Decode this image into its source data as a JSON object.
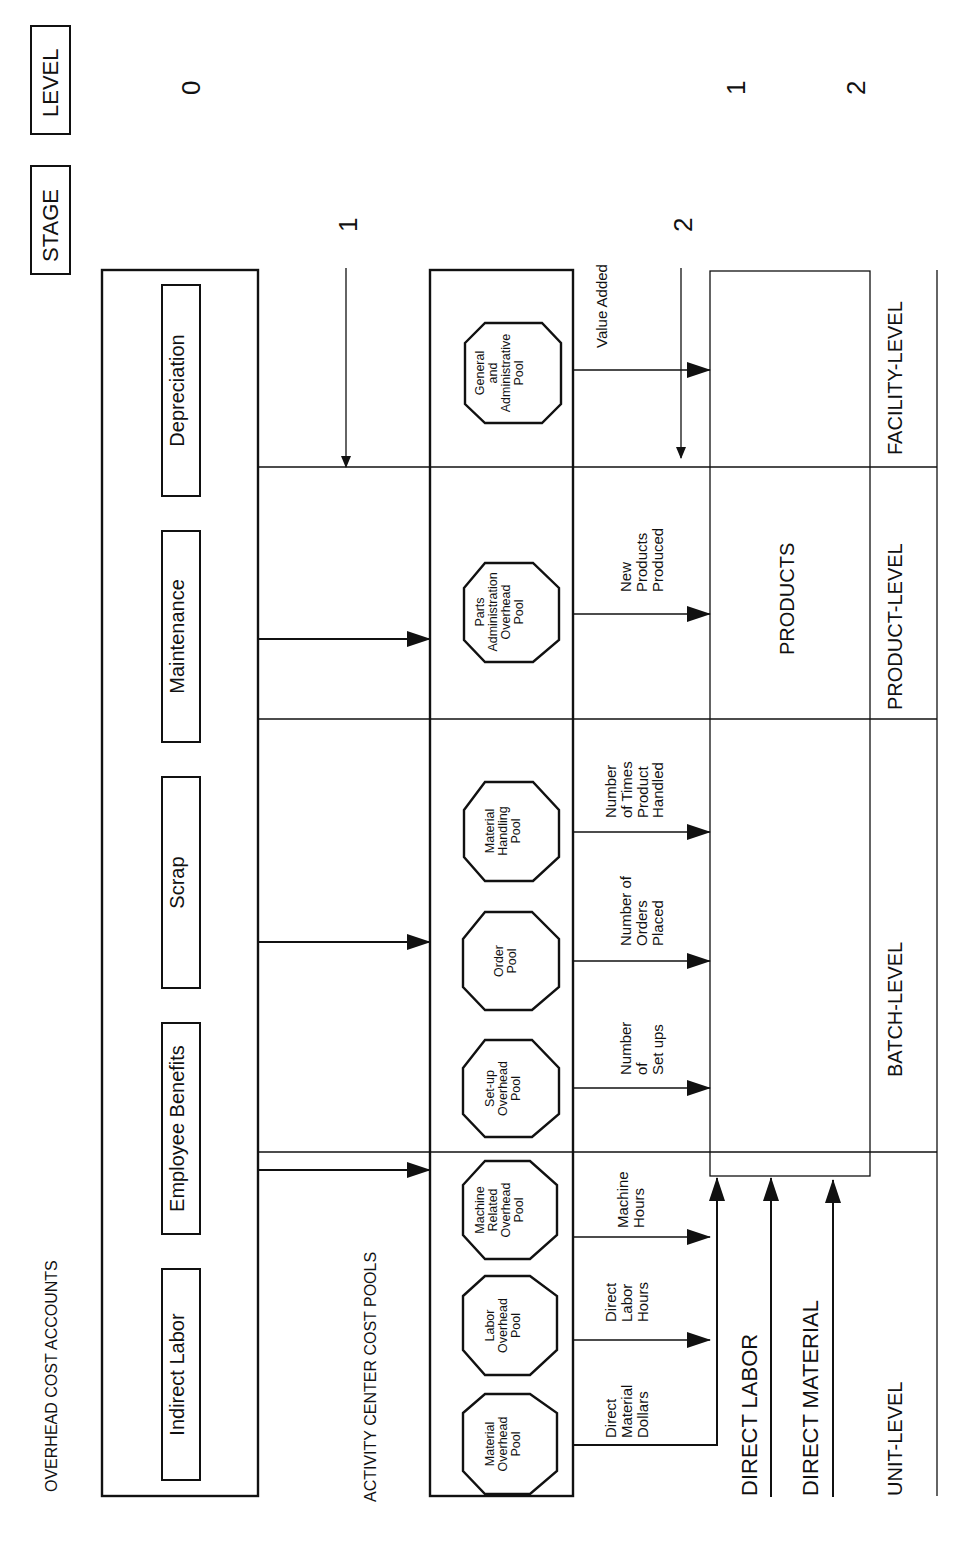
{
  "header": {
    "stage_label": "STAGE",
    "level_label": "LEVEL",
    "level_markers": [
      "0",
      "1",
      "2"
    ],
    "stage_markers": [
      "1",
      "2"
    ]
  },
  "overhead_cost_accounts": {
    "title": "OVERHEAD COST ACCOUNTS",
    "items": [
      "Indirect Labor",
      "Employee Benefits",
      "Scrap",
      "Maintenance",
      "Depreciation"
    ]
  },
  "activity_center_cost_pools": {
    "title": "ACTIVITY CENTER COST POOLS",
    "pools": [
      {
        "lines": [
          "Material",
          "Overhead",
          "Pool"
        ],
        "level": "UNIT-LEVEL"
      },
      {
        "lines": [
          "Labor",
          "Overhead",
          "Pool"
        ],
        "level": "UNIT-LEVEL"
      },
      {
        "lines": [
          "Machine",
          "Related",
          "Overhead",
          "Pool"
        ],
        "level": "UNIT-LEVEL"
      },
      {
        "lines": [
          "Set-up",
          "Overhead",
          "Pool"
        ],
        "level": "BATCH-LEVEL"
      },
      {
        "lines": [
          "Order",
          "Pool"
        ],
        "level": "BATCH-LEVEL"
      },
      {
        "lines": [
          "Material",
          "Handling",
          "Pool"
        ],
        "level": "BATCH-LEVEL"
      },
      {
        "lines": [
          "Parts",
          "Administration",
          "Overhead",
          "Pool"
        ],
        "level": "PRODUCT-LEVEL"
      },
      {
        "lines": [
          "General",
          "and",
          "Administrative",
          "Pool"
        ],
        "level": "FACILITY-LEVEL"
      }
    ]
  },
  "cost_drivers": [
    {
      "lines": [
        "Direct",
        "Material",
        "Dollars"
      ]
    },
    {
      "lines": [
        "Direct",
        "Labor",
        "Hours"
      ]
    },
    {
      "lines": [
        "Machine",
        "Hours"
      ]
    },
    {
      "lines": [
        "Number",
        "of",
        "Set ups"
      ]
    },
    {
      "lines": [
        "Number of",
        "Orders",
        "Placed"
      ]
    },
    {
      "lines": [
        "Number",
        "of Times",
        "Product",
        "Handled"
      ]
    },
    {
      "lines": [
        "New",
        "Products",
        "Produced"
      ]
    },
    {
      "lines": [
        "Value Added"
      ]
    }
  ],
  "products": {
    "label": "PRODUCTS",
    "direct_inputs": [
      "DIRECT LABOR",
      "DIRECT MATERIAL"
    ]
  },
  "levels": [
    "UNIT-LEVEL",
    "BATCH-LEVEL",
    "PRODUCT-LEVEL",
    "FACILITY-LEVEL"
  ]
}
